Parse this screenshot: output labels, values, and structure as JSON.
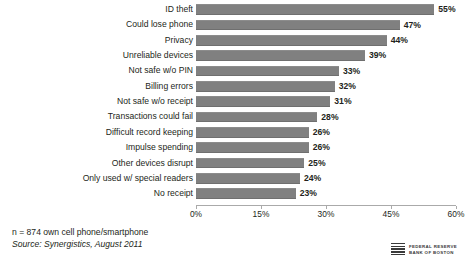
{
  "chart_data": {
    "type": "bar",
    "orientation": "horizontal",
    "title": "",
    "xlabel": "",
    "ylabel": "",
    "xlim": [
      0,
      60
    ],
    "grid": false,
    "legend": null,
    "categories": [
      "ID theft",
      "Could lose phone",
      "Privacy",
      "Unreliable devices",
      "Not safe w/o PIN",
      "Billing errors",
      "Not safe w/o receipt",
      "Transactions could fail",
      "Difficult record keeping",
      "Impulse spending",
      "Other devices disrupt",
      "Only used w/ special readers",
      "No receipt"
    ],
    "values": [
      55,
      47,
      44,
      39,
      33,
      32,
      31,
      28,
      26,
      26,
      25,
      24,
      23
    ],
    "value_labels": [
      "55%",
      "47%",
      "44%",
      "39%",
      "33%",
      "32%",
      "31%",
      "28%",
      "26%",
      "26%",
      "25%",
      "24%",
      "23%"
    ],
    "xticks": [
      0,
      15,
      30,
      45,
      60
    ],
    "xtick_labels": [
      "0%",
      "15%",
      "30%",
      "45%",
      "60%"
    ],
    "bar_color": "#808080"
  },
  "footnotes": {
    "sample": "n = 874 own cell phone/smartphone",
    "source": "Source: Synergistics, August 2011"
  },
  "logo": {
    "line1": "FEDERAL RESERVE",
    "line2": "BANK OF BOSTON"
  }
}
